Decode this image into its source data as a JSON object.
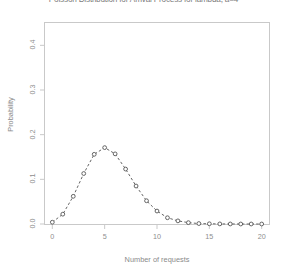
{
  "chart_data": {
    "type": "line",
    "title": "Poisson Distribution for Arrival Process for lambda, a=4",
    "xlabel": "Number of requests",
    "ylabel": "Probability",
    "xlim": [
      -0.7,
      20.7
    ],
    "ylim": [
      0.0,
      0.45
    ],
    "xticks": [
      0,
      5,
      10,
      15,
      20
    ],
    "xtick_labels": [
      "0",
      "5",
      "10",
      "15",
      "20"
    ],
    "yticks": [
      0.0,
      0.1,
      0.2,
      0.3,
      0.4
    ],
    "ytick_labels": [
      "0.0",
      "0.1",
      "0.2",
      "0.3",
      "0.4"
    ],
    "grid": false,
    "legend": false,
    "marker": "open-circle",
    "linestyle": "dashed",
    "color": "#555555",
    "x": [
      0,
      1,
      2,
      3,
      4,
      5,
      6,
      7,
      8,
      9,
      10,
      11,
      12,
      13,
      14,
      15,
      16,
      17,
      18,
      19,
      20
    ],
    "values": [
      0.004,
      0.022,
      0.062,
      0.113,
      0.156,
      0.171,
      0.157,
      0.123,
      0.085,
      0.052,
      0.029,
      0.014,
      0.007,
      0.003,
      0.001,
      0.0005,
      0.0002,
      0.0001,
      0.0,
      0.0,
      0.0
    ],
    "series": [
      {
        "name": "Poisson pmf",
        "values": [
          0.004,
          0.022,
          0.062,
          0.113,
          0.156,
          0.171,
          0.157,
          0.123,
          0.085,
          0.052,
          0.029,
          0.014,
          0.007,
          0.003,
          0.001,
          0.0005,
          0.0002,
          0.0001,
          0.0,
          0.0,
          0.0
        ]
      }
    ]
  },
  "axis_colors": {
    "frame": "#c9c9c9",
    "text": "#8a8a8a",
    "data": "#555555"
  }
}
